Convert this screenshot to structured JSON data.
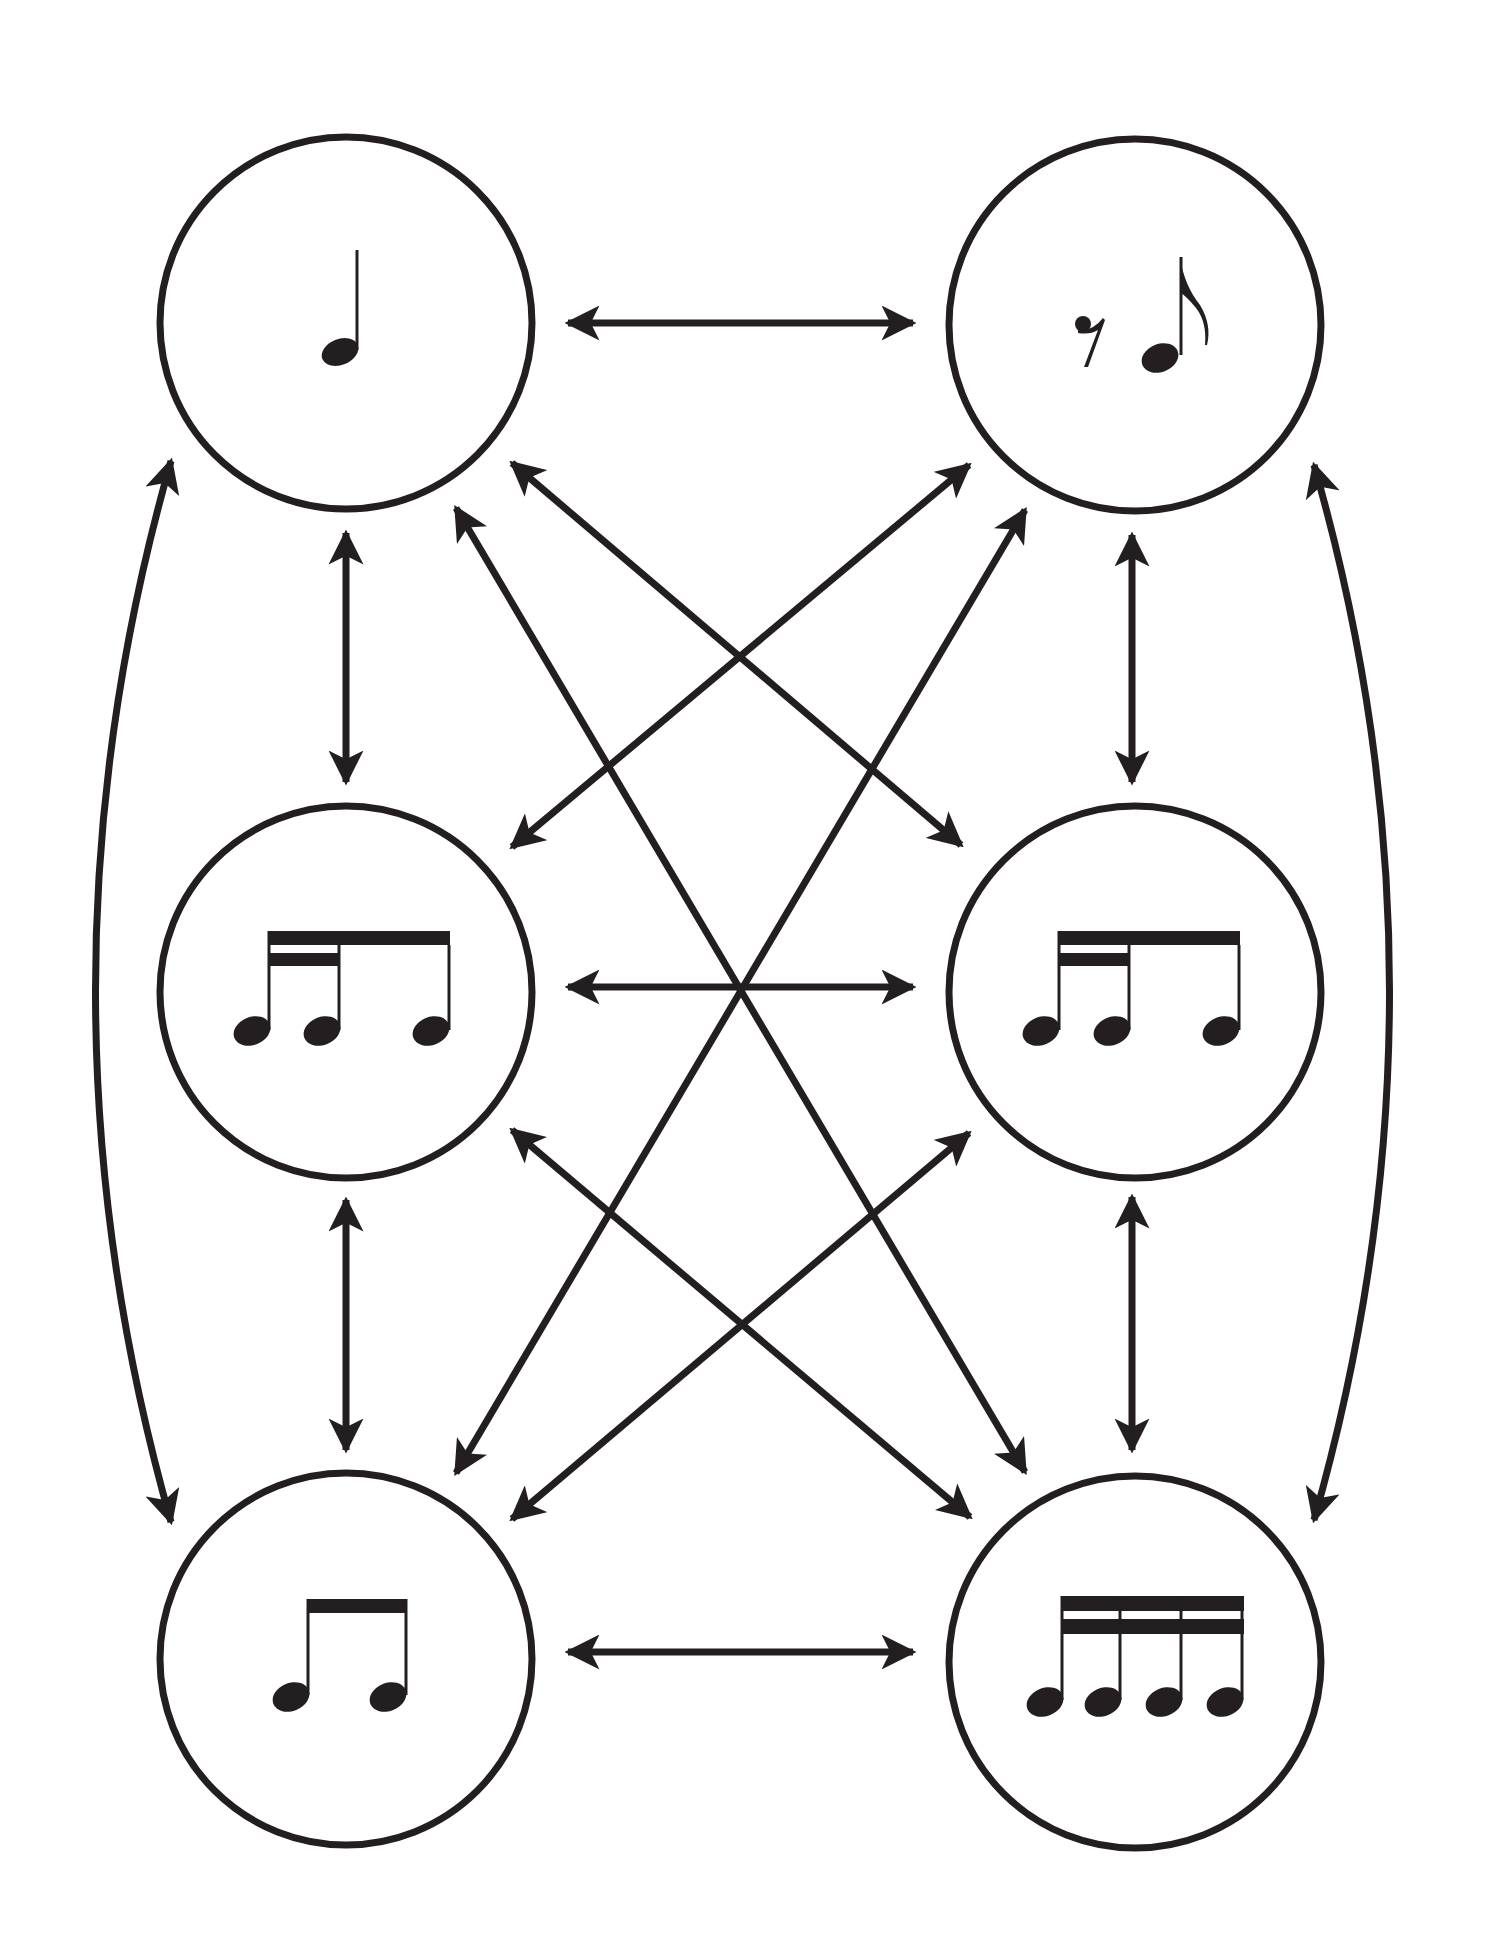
{
  "diagram": {
    "type": "rhythm-transformation-graph",
    "colors": {
      "ink": "#231f20",
      "background": "#ffffff"
    },
    "nodes": [
      {
        "id": "tl",
        "label": "Quarter note",
        "position": "top-left"
      },
      {
        "id": "tr",
        "label": "Eighth rest + eighth note",
        "position": "top-right"
      },
      {
        "id": "ml",
        "label": "Two sixteenths + eighth",
        "position": "middle-left"
      },
      {
        "id": "mr",
        "label": "Two sixteenths + eighth",
        "position": "middle-right"
      },
      {
        "id": "bl",
        "label": "Two beamed eighth notes",
        "position": "bottom-left"
      },
      {
        "id": "br",
        "label": "Four beamed sixteenth notes",
        "position": "bottom-right"
      }
    ],
    "edges": [
      {
        "from": "tl",
        "to": "tr",
        "style": "bidirectional"
      },
      {
        "from": "ml",
        "to": "mr",
        "style": "bidirectional"
      },
      {
        "from": "bl",
        "to": "br",
        "style": "bidirectional"
      },
      {
        "from": "tl",
        "to": "ml",
        "style": "bidirectional"
      },
      {
        "from": "ml",
        "to": "bl",
        "style": "bidirectional"
      },
      {
        "from": "tr",
        "to": "mr",
        "style": "bidirectional"
      },
      {
        "from": "mr",
        "to": "br",
        "style": "bidirectional"
      },
      {
        "from": "tl",
        "to": "bl",
        "style": "bidirectional-curved"
      },
      {
        "from": "tr",
        "to": "br",
        "style": "bidirectional-curved"
      },
      {
        "from": "tl",
        "to": "mr",
        "style": "bidirectional"
      },
      {
        "from": "tr",
        "to": "ml",
        "style": "bidirectional"
      },
      {
        "from": "tl",
        "to": "br",
        "style": "bidirectional"
      },
      {
        "from": "tr",
        "to": "bl",
        "style": "bidirectional"
      },
      {
        "from": "ml",
        "to": "br",
        "style": "bidirectional"
      },
      {
        "from": "mr",
        "to": "bl",
        "style": "bidirectional"
      }
    ]
  }
}
